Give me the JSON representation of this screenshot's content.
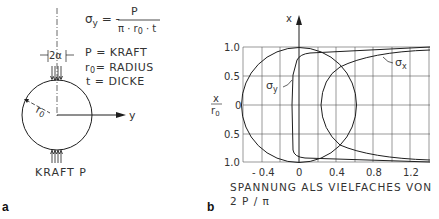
{
  "panel_a": {
    "label": "a",
    "formula": {
      "lhs": "σy = -",
      "numerator": "P",
      "denominator": "π · r0 · t"
    },
    "legend": [
      {
        "symbol": "P",
        "text": "P = KRAFT"
      },
      {
        "symbol": "r0",
        "text": "r0 = RADIUS"
      },
      {
        "symbol": "t",
        "text": "t = DICKE"
      }
    ],
    "angle_label": "2α",
    "radius_label": "r0",
    "axis_y_label": "y",
    "force_label": "KRAFT P"
  },
  "panel_b": {
    "label": "b",
    "x_axis_label": "x",
    "y_axis_label_num": "x",
    "y_axis_label_den": "r0",
    "y_ticks": [
      "1.0",
      "0.5",
      "0",
      "0.5",
      "1.0"
    ],
    "x_ticks": [
      "- 0.4",
      "0",
      "0.4",
      "0.8",
      "1.2"
    ],
    "xlabel_line1": "SPANNUNG ALS VIELFACHES VON",
    "xlabel_line2": "2 P / π",
    "curve_labels": {
      "sigma_y": "σy",
      "sigma_x": "σx"
    }
  },
  "colors": {
    "line": "#1e1e1e",
    "grid": "#555555",
    "text": "#333333"
  }
}
